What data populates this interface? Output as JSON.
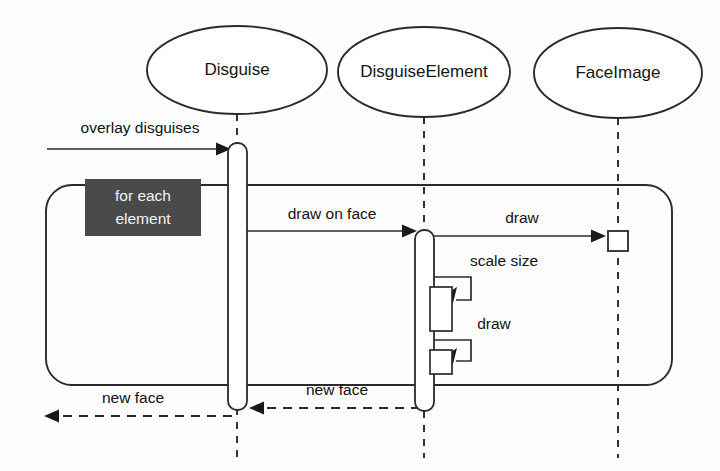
{
  "diagram": {
    "kind": "uml-sequence-diagram",
    "title": "",
    "background_color": "#fdfdfd",
    "line_color": "#2b2b2b",
    "text_color": "#121212"
  },
  "lifelines": [
    {
      "id": "disguise",
      "label": "Disguise",
      "center_x": 237,
      "ellipse": {
        "cx": 237,
        "cy": 70,
        "rx": 90,
        "ry": 44
      },
      "lifeline_top": 114,
      "lifeline_bottom": 458,
      "activation": {
        "x": 228,
        "y": 143,
        "width": 19,
        "height": 267,
        "corner_radius": 9
      }
    },
    {
      "id": "disguiseelement",
      "label": "DisguiseElement",
      "center_x": 424,
      "ellipse": {
        "cx": 424,
        "cy": 72,
        "rx": 86,
        "ry": 45
      },
      "lifeline_top": 117,
      "lifeline_bottom": 458,
      "activation": {
        "x": 415,
        "y": 230,
        "width": 19,
        "height": 181,
        "corner_radius": 9
      }
    },
    {
      "id": "faceimage",
      "label": "FaceImage",
      "center_x": 618,
      "ellipse": {
        "cx": 618,
        "cy": 73,
        "rx": 84,
        "ry": 45
      },
      "lifeline_top": 118,
      "lifeline_bottom": 458,
      "activation": {
        "x": 608,
        "y": 231,
        "width": 20,
        "height": 20,
        "corner_radius": 0
      }
    }
  ],
  "messages": [
    {
      "id": "overlay-disguises",
      "label": "overlay disguises",
      "style": "solid",
      "direction": "right",
      "from_x": 47,
      "to_x": 231,
      "y": 149,
      "label_x": 140,
      "label_y": 129
    },
    {
      "id": "draw-on-face",
      "label": "draw on face",
      "style": "solid",
      "direction": "right",
      "from_x": 247,
      "to_x": 417,
      "y": 231,
      "label_x": 332,
      "label_y": 215
    },
    {
      "id": "draw-to-faceimage",
      "label": "draw",
      "style": "solid",
      "direction": "right",
      "from_x": 434,
      "to_x": 606,
      "y": 236,
      "label_x": 522,
      "label_y": 219
    },
    {
      "id": "new-face-element-to-disguise",
      "label": "new face",
      "style": "dashed",
      "direction": "left",
      "from_x": 420,
      "to_x": 249,
      "y": 408,
      "label_x": 337,
      "label_y": 391
    },
    {
      "id": "new-face-disguise-to-caller",
      "label": "new face",
      "style": "dashed",
      "direction": "left",
      "from_x": 232,
      "to_x": 44,
      "y": 416,
      "label_x": 133,
      "label_y": 399
    }
  ],
  "self_messages": [
    {
      "id": "scale-size",
      "label": "scale size",
      "label_x": 504,
      "label_y": 262,
      "start_x": 434,
      "start_y": 277,
      "out_x": 471,
      "end_y": 300,
      "target_box": {
        "x": 430,
        "y": 287,
        "width": 22,
        "height": 44
      }
    },
    {
      "id": "draw-self",
      "label": "draw",
      "label_x": 494,
      "label_y": 325,
      "start_x": 434,
      "start_y": 340,
      "out_x": 471,
      "end_y": 361,
      "target_box": {
        "x": 430,
        "y": 350,
        "width": 22,
        "height": 24
      }
    }
  ],
  "loop": {
    "id": "for-each-element-loop",
    "box": {
      "x": 46,
      "y": 185,
      "width": 626,
      "height": 200,
      "corner_radius": 26
    },
    "note": {
      "label_line_1": "for each",
      "label_line_2": "element",
      "x": 85,
      "y": 179,
      "width": 116,
      "height": 57,
      "fill": "#4a4a4a",
      "text_color": "#f2f2f2"
    }
  }
}
